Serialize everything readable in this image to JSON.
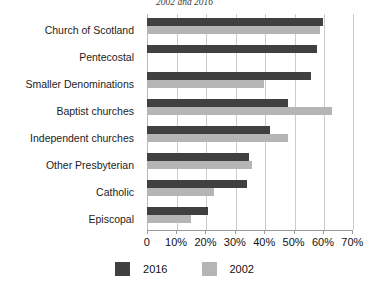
{
  "chart_data": {
    "type": "bar",
    "orientation": "horizontal",
    "title": "2002 and 2016",
    "xlabel": "",
    "ylabel": "",
    "xlim": [
      0,
      70
    ],
    "xticks": [
      "0",
      "10%",
      "20%",
      "30%",
      "40%",
      "50%",
      "60%",
      "70%"
    ],
    "xtick_values": [
      0,
      10,
      20,
      30,
      40,
      50,
      60,
      70
    ],
    "grid": true,
    "legend_position": "bottom",
    "categories": [
      "Church of Scotland",
      "Pentecostal",
      "Smaller Denominations",
      "Baptist churches",
      "Independent churches",
      "Other Presbyterian",
      "Catholic",
      "Episcopal"
    ],
    "series": [
      {
        "name": "2016",
        "color": "#404040",
        "values": [
          60,
          58,
          56,
          48,
          42,
          35,
          34,
          21
        ]
      },
      {
        "name": "2002",
        "color": "#b5b5b5",
        "values": [
          59,
          0,
          40,
          63,
          48,
          36,
          23,
          15
        ]
      }
    ]
  },
  "legend": {
    "items": [
      {
        "label": "2016",
        "color": "#404040"
      },
      {
        "label": "2002",
        "color": "#b5b5b5"
      }
    ]
  }
}
